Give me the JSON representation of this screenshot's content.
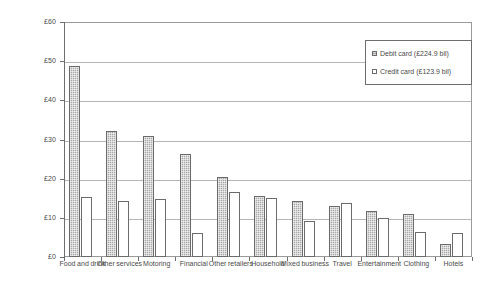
{
  "chart_data": {
    "type": "bar",
    "title": "",
    "subtitle": "",
    "xlabel": "",
    "ylabel": "",
    "ylim": [
      0,
      60
    ],
    "ytick_labels": [
      "£0",
      "£10",
      "£20",
      "£30",
      "£40",
      "£50",
      "£60"
    ],
    "ytick_values": [
      0,
      10,
      20,
      30,
      40,
      50,
      60
    ],
    "grid": "horizontal",
    "legend_position": "top-right",
    "categories": [
      "Food and drink",
      "Other services",
      "Motoring",
      "Financial",
      "Other retailers",
      "Household",
      "Mixed business",
      "Travel",
      "Entertainment",
      "Clothing",
      "Hotels"
    ],
    "series": [
      {
        "name": "Debit card (£224.9 bil)",
        "short_name": "Debit card",
        "total": "£224.9 bil",
        "fill": "hatched-grey",
        "values": [
          48.7,
          32.3,
          31.0,
          26.3,
          20.5,
          15.6,
          14.4,
          12.9,
          11.7,
          10.9,
          3.3
        ]
      },
      {
        "name": "Credit card (£123.9 bil)",
        "short_name": "Credit card",
        "total": "£123.9 bil",
        "fill": "white",
        "values": [
          15.4,
          14.2,
          14.9,
          6.1,
          16.7,
          15.1,
          9.2,
          13.8,
          9.9,
          6.5,
          6.2
        ]
      }
    ]
  },
  "legend": {
    "items": [
      {
        "label": "Debit card (£224.9 bil)"
      },
      {
        "label": "Credit card (£123.9 bil)"
      }
    ]
  },
  "colors": {
    "debit_fill": "#a8a8a8",
    "credit_fill": "#ffffff",
    "bar_outline": "#6b6b6b",
    "gridline": "#b5b5b5",
    "axis": "#6e6e6e",
    "text": "#4a4a4a",
    "background": "#ffffff"
  }
}
